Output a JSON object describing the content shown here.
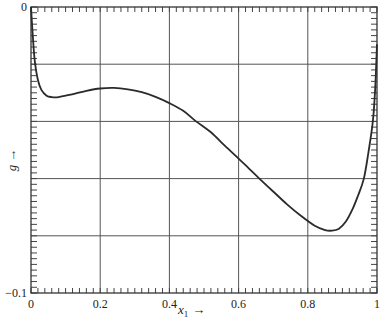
{
  "chart_data": {
    "type": "line",
    "title": "",
    "xlabel": "x1 →",
    "xlabel_main": "x",
    "xlabel_sub": "1",
    "xlabel_arrow": "→",
    "ylabel": "g →",
    "ylabel_main": "g",
    "ylabel_arrow": "→",
    "xlim": [
      0,
      1
    ],
    "ylim": [
      -0.1,
      0
    ],
    "x_ticks": [
      0,
      0.2,
      0.4,
      0.6,
      0.8,
      1
    ],
    "x_tick_labels": [
      "0",
      "0.2",
      "0.4",
      "0.6",
      "0.8",
      "1"
    ],
    "y_ticks": [
      0,
      -0.02,
      -0.04,
      -0.06,
      -0.08,
      -0.1
    ],
    "y_tick_labels": [
      "0",
      "",
      "",
      "",
      "",
      "−0.1"
    ],
    "grid": true,
    "legend": null,
    "series": [
      {
        "name": "g(x1)",
        "x": [
          0.0,
          0.004,
          0.008,
          0.012,
          0.02,
          0.03,
          0.045,
          0.06,
          0.08,
          0.1,
          0.13,
          0.16,
          0.2,
          0.24,
          0.28,
          0.32,
          0.36,
          0.4,
          0.44,
          0.477,
          0.52,
          0.56,
          0.6,
          0.63,
          0.66,
          0.7,
          0.74,
          0.78,
          0.82,
          0.85,
          0.87,
          0.89,
          0.91,
          0.93,
          0.945,
          0.962,
          0.975,
          0.988,
          0.995,
          1.0
        ],
        "y": [
          0.0,
          -0.008,
          -0.015,
          -0.02,
          -0.0255,
          -0.029,
          -0.031,
          -0.0315,
          -0.0315,
          -0.031,
          -0.0302,
          -0.0293,
          -0.0285,
          -0.0283,
          -0.0288,
          -0.0298,
          -0.0314,
          -0.0336,
          -0.0363,
          -0.04,
          -0.0438,
          -0.0485,
          -0.053,
          -0.0565,
          -0.06,
          -0.0645,
          -0.069,
          -0.073,
          -0.0765,
          -0.078,
          -0.0782,
          -0.0775,
          -0.075,
          -0.0705,
          -0.066,
          -0.06,
          -0.051,
          -0.04,
          -0.028,
          -0.013
        ]
      }
    ]
  }
}
